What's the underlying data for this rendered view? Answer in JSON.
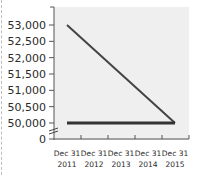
{
  "chart_data": {
    "type": "line",
    "title": "",
    "xlabel": "",
    "ylabel": "",
    "categories": [
      [
        "Dec 31",
        "2011"
      ],
      [
        "Dec 31",
        "2012"
      ],
      [
        "Dec 31",
        "2013"
      ],
      [
        "Dec 31",
        "2014"
      ],
      [
        "Dec 31",
        "2015"
      ]
    ],
    "series": [
      {
        "name": "Declining series",
        "values": [
          53000,
          52250,
          51500,
          50750,
          50000
        ],
        "color": "#444444"
      },
      {
        "name": "Flat series",
        "values": [
          50000,
          50000,
          50000,
          50000,
          50000
        ],
        "color": "#333333"
      }
    ],
    "yticks": [
      "0",
      "50,000",
      "50,500",
      "51,000",
      "51,500",
      "52,000",
      "52,500",
      "53,000"
    ],
    "ylim": [
      50000,
      53000
    ],
    "axis_break": true,
    "grid": false,
    "legend": "none",
    "plot_background": "#efefef"
  }
}
